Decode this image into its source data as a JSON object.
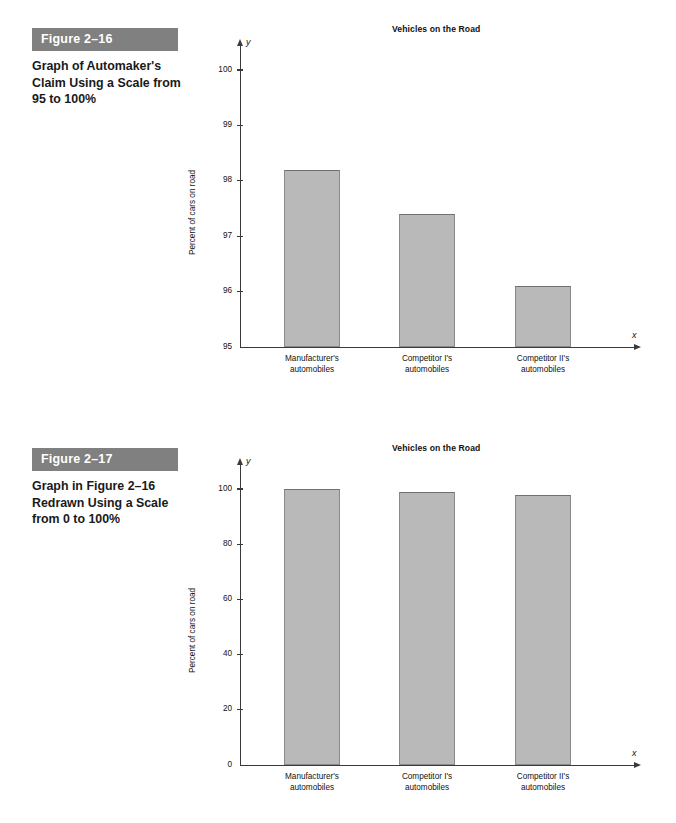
{
  "figures": [
    {
      "banner": "Figure 2–16",
      "caption": "Graph of Automaker's Claim Using a Scale from 95 to 100%",
      "chart_data": {
        "type": "bar",
        "title": "Vehicles on the Road",
        "xlabel": "x",
        "ylabel": "Percent of cars on road",
        "ylim": [
          95,
          100
        ],
        "yticks": [
          "95",
          "96",
          "97",
          "98",
          "99",
          "100"
        ],
        "ytick_values": [
          95,
          96,
          97,
          98,
          99,
          100
        ],
        "grid": false,
        "legend": "none",
        "axis_letters": {
          "x": "x",
          "y": "y"
        },
        "categories": [
          "Manufacturer's automobiles",
          "Competitor I's automobiles",
          "Competitor II's automobiles"
        ],
        "category_lines": [
          [
            "Manufacturer's",
            "automobiles"
          ],
          [
            "Competitor I's",
            "automobiles"
          ],
          [
            "Competitor II's",
            "automobiles"
          ]
        ],
        "values": [
          98.2,
          97.4,
          96.1
        ],
        "bar_color": "#b9b9b9"
      }
    },
    {
      "banner": "Figure 2–17",
      "caption": "Graph in Figure 2–16 Redrawn Using a Scale from 0 to 100%",
      "chart_data": {
        "type": "bar",
        "title": "Vehicles on the Road",
        "xlabel": "x",
        "ylabel": "Percent of cars on road",
        "ylim": [
          0,
          100
        ],
        "yticks": [
          "0",
          "20",
          "40",
          "60",
          "80",
          "100"
        ],
        "ytick_values": [
          0,
          20,
          40,
          60,
          80,
          100
        ],
        "grid": false,
        "legend": "none",
        "axis_letters": {
          "x": "x",
          "y": "y"
        },
        "categories": [
          "Manufacturer's automobiles",
          "Competitor I's automobiles",
          "Competitor II's automobiles"
        ],
        "category_lines": [
          [
            "Manufacturer's",
            "automobiles"
          ],
          [
            "Competitor I's",
            "automobiles"
          ],
          [
            "Competitor II's",
            "automobiles"
          ]
        ],
        "values": [
          100,
          99,
          98
        ],
        "bar_color": "#b9b9b9"
      }
    }
  ]
}
